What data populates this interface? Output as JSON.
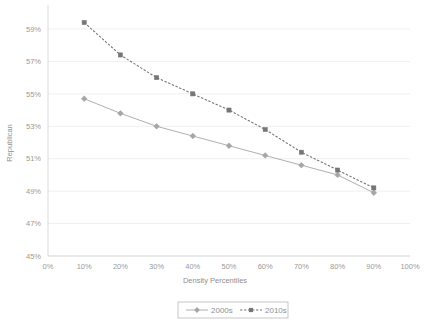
{
  "chart_data": {
    "type": "line",
    "title": "",
    "xlabel": "Density Percentiles",
    "ylabel": "Republican",
    "xlim": [
      0,
      100
    ],
    "ylim": [
      45,
      59
    ],
    "grid": true,
    "legend_position": "bottom",
    "x": [
      10,
      20,
      30,
      40,
      50,
      60,
      70,
      80,
      90
    ],
    "xtick_labels": [
      "0%",
      "10%",
      "20%",
      "30%",
      "40%",
      "50%",
      "60%",
      "70%",
      "80%",
      "90%",
      "100%"
    ],
    "xtick_values": [
      0,
      10,
      20,
      30,
      40,
      50,
      60,
      70,
      80,
      90,
      100
    ],
    "ytick_labels": [
      "45%",
      "47%",
      "49%",
      "51%",
      "53%",
      "55%",
      "57%",
      "59%"
    ],
    "ytick_values": [
      45,
      47,
      49,
      51,
      53,
      55,
      57,
      59
    ],
    "series": [
      {
        "name": "2000s",
        "color": "#a6a6a6",
        "linestyle": "solid",
        "marker": "diamond",
        "values": [
          54.7,
          53.8,
          53.0,
          52.4,
          51.8,
          51.2,
          50.6,
          50.0,
          48.9
        ]
      },
      {
        "name": "2010s",
        "color": "#767676",
        "linestyle": "dashed",
        "marker": "square",
        "values": [
          59.4,
          57.4,
          56.0,
          55.0,
          54.0,
          52.8,
          51.4,
          50.3,
          49.2
        ]
      }
    ]
  },
  "legend": {
    "entries": [
      {
        "label": "2000s"
      },
      {
        "label": "2010s"
      }
    ]
  },
  "axes": {
    "x_title": "Density Percentiles",
    "y_title": "Republican"
  }
}
